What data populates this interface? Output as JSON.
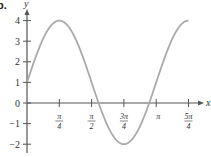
{
  "problem_label": "b.",
  "chart_data": {
    "type": "line",
    "title": "",
    "xlabel": "x",
    "ylabel": "y",
    "function": "y = 1 + 3 sin(2x)",
    "xlim": [
      0,
      3.927
    ],
    "ylim": [
      -2.5,
      4.5
    ],
    "grid": false,
    "legend": null,
    "x_ticks": [
      {
        "value": 0.7854,
        "label": "π/4",
        "num": "π",
        "den": "4"
      },
      {
        "value": 1.5708,
        "label": "π/2",
        "num": "π",
        "den": "2"
      },
      {
        "value": 2.3562,
        "label": "3π/4",
        "num": "3π",
        "den": "4"
      },
      {
        "value": 3.1416,
        "label": "π",
        "num": "π",
        "den": ""
      },
      {
        "value": 3.927,
        "label": "5π/4",
        "num": "5π",
        "den": "4"
      }
    ],
    "y_ticks": [
      {
        "value": 4,
        "label": "4"
      },
      {
        "value": 3,
        "label": "3"
      },
      {
        "value": 2,
        "label": "2"
      },
      {
        "value": 1,
        "label": "1"
      },
      {
        "value": 0,
        "label": "0"
      },
      {
        "value": -1,
        "label": "−1"
      },
      {
        "value": -2,
        "label": "−2"
      }
    ],
    "series": [
      {
        "name": "y = 1 + 3 sin(2x)",
        "color": "#aaaaaa",
        "x": [
          0,
          0.3927,
          0.7854,
          1.1781,
          1.5708,
          1.9635,
          2.3562,
          2.7489,
          3.1416,
          3.5343,
          3.927
        ],
        "values": [
          1,
          3.12,
          4,
          3.12,
          1,
          -1.12,
          -2,
          -1.12,
          1,
          3.12,
          4
        ]
      }
    ]
  },
  "colors": {
    "axis": "#555555",
    "curve": "#aaaaaa",
    "text": "#333333"
  }
}
